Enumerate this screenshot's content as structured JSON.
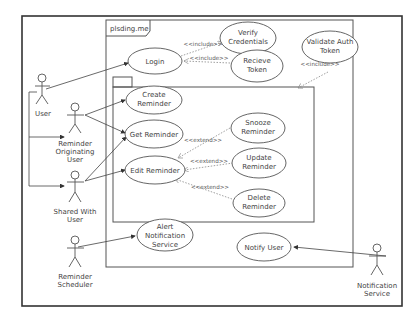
{
  "diagram": {
    "type": "uml-use-case",
    "system_frame": {
      "label": "plsding.me"
    },
    "actors": [
      {
        "id": "user",
        "label": [
          "User"
        ]
      },
      {
        "id": "originating",
        "label": [
          "Reminder",
          "Originating",
          "User"
        ]
      },
      {
        "id": "shared",
        "label": [
          "Shared With",
          "User"
        ]
      },
      {
        "id": "scheduler",
        "label": [
          "Reminder",
          "Scheduler"
        ]
      },
      {
        "id": "notif",
        "label": [
          "Notification",
          "Service"
        ]
      }
    ],
    "use_cases": [
      {
        "id": "login",
        "label": [
          "Login"
        ]
      },
      {
        "id": "verify",
        "label": [
          "Verify",
          "Credentials"
        ]
      },
      {
        "id": "receive",
        "label": [
          "Recieve",
          "Token"
        ]
      },
      {
        "id": "validate",
        "label": [
          "Validate Auth",
          "Token"
        ]
      },
      {
        "id": "create",
        "label": [
          "Create",
          "Reminder"
        ]
      },
      {
        "id": "get",
        "label": [
          "Get Reminder"
        ]
      },
      {
        "id": "edit",
        "label": [
          "Edit Reminder"
        ]
      },
      {
        "id": "snooze",
        "label": [
          "Snooze",
          "Reminder"
        ]
      },
      {
        "id": "update",
        "label": [
          "Update",
          "Reminder"
        ]
      },
      {
        "id": "delete",
        "label": [
          "Delete",
          "Reminder"
        ]
      },
      {
        "id": "alert",
        "label": [
          "Alert",
          "Notification",
          "Service"
        ]
      },
      {
        "id": "notify",
        "label": [
          "Notify User"
        ]
      }
    ],
    "relationships": [
      {
        "from": "user",
        "to": "login",
        "kind": "association"
      },
      {
        "from": "originating",
        "to": "create",
        "kind": "association"
      },
      {
        "from": "originating",
        "to": "get",
        "kind": "association"
      },
      {
        "from": "shared",
        "to": "get",
        "kind": "association"
      },
      {
        "from": "shared",
        "to": "edit",
        "kind": "association"
      },
      {
        "from": "user",
        "to": "originating",
        "kind": "generalization"
      },
      {
        "from": "user",
        "to": "shared",
        "kind": "generalization"
      },
      {
        "from": "login",
        "to": "verify",
        "kind": "include",
        "label": "<<include>>"
      },
      {
        "from": "login",
        "to": "receive",
        "kind": "include",
        "label": "<<include>>"
      },
      {
        "from": "validate",
        "to": "package",
        "kind": "include",
        "label": "<<include>>"
      },
      {
        "from": "snooze",
        "to": "get",
        "kind": "extend",
        "label": "<<extend>>"
      },
      {
        "from": "update",
        "to": "edit",
        "kind": "extend",
        "label": "<<extend>>"
      },
      {
        "from": "delete",
        "to": "edit",
        "kind": "extend",
        "label": "<<extend>>"
      },
      {
        "from": "scheduler",
        "to": "alert",
        "kind": "association"
      },
      {
        "from": "notif",
        "to": "notify",
        "kind": "association"
      }
    ],
    "labels": {
      "include": "<<include>>",
      "extend": "<<extend>>"
    }
  }
}
